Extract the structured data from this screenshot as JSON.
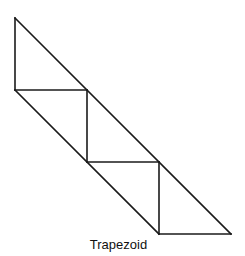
{
  "figure": {
    "caption": "Trapezoid",
    "stroke_color": "#1a1a1a",
    "stroke_width": 1.6,
    "shape": "trapezoid composed of tiled right triangles",
    "segments": [
      {
        "x1": 15,
        "y1": 18,
        "x2": 231,
        "y2": 234
      },
      {
        "x1": 15,
        "y1": 90,
        "x2": 159,
        "y2": 234
      },
      {
        "x1": 15,
        "y1": 18,
        "x2": 15,
        "y2": 90
      },
      {
        "x1": 15,
        "y1": 90,
        "x2": 87,
        "y2": 90
      },
      {
        "x1": 87,
        "y1": 90,
        "x2": 87,
        "y2": 162
      },
      {
        "x1": 87,
        "y1": 162,
        "x2": 159,
        "y2": 162
      },
      {
        "x1": 159,
        "y1": 162,
        "x2": 159,
        "y2": 234
      },
      {
        "x1": 159,
        "y1": 234,
        "x2": 231,
        "y2": 234
      }
    ]
  }
}
